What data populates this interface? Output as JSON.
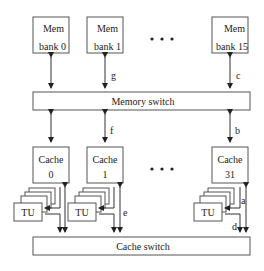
{
  "diagram": {
    "memory_banks": [
      {
        "line1": "Mem",
        "line2": "bank 0"
      },
      {
        "line1": "Mem",
        "line2": "bank 1"
      },
      {
        "line1": "Mem",
        "line2": "bank 15"
      }
    ],
    "memory_switch": "Memory switch",
    "caches": [
      {
        "line1": "Cache",
        "line2": "0"
      },
      {
        "line1": "Cache",
        "line2": "1"
      },
      {
        "line1": "Cache",
        "line2": "31"
      }
    ],
    "tu_label": "TU",
    "cache_switch": "Cache switch",
    "ellipsis": "• • •",
    "link_labels": {
      "a": "a",
      "b": "b",
      "c": "c",
      "d": "d",
      "e": "e",
      "f": "f",
      "g": "g"
    }
  }
}
